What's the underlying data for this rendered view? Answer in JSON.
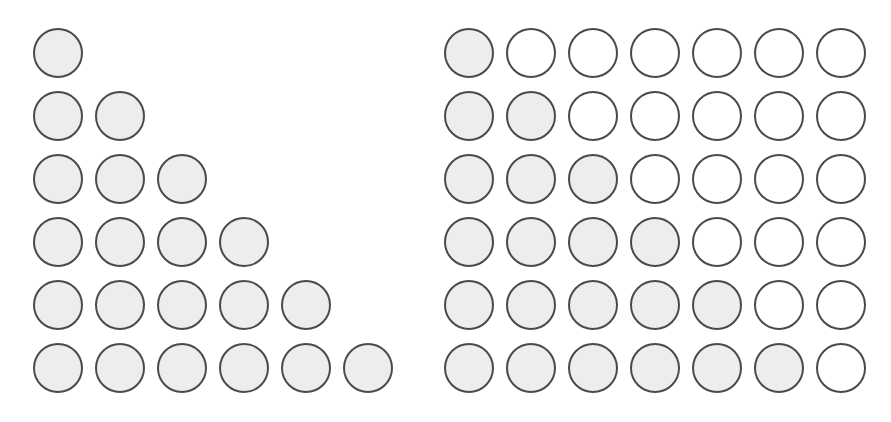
{
  "figure": {
    "background_color": "#ffffff",
    "width": 891,
    "height": 422
  },
  "style": {
    "circle_stroke_color": "#4a4a4a",
    "circle_fill_color": "#ededed",
    "circle_empty_color": "#ffffff",
    "circle_diameter": 50,
    "circle_stroke_width": 2
  },
  "chart_data": {
    "type": "diagram",
    "xlabel": "",
    "ylabel": "",
    "panels": [
      {
        "name": "triangle",
        "label": "Staircase triangle",
        "rows": 6,
        "columns": 6,
        "filled_per_row": [
          1,
          2,
          3,
          4,
          5,
          6
        ],
        "empty_per_row": [
          0,
          0,
          0,
          0,
          0,
          0
        ],
        "total_circles": 21,
        "total_filled": 21,
        "total_empty": 0,
        "origin_x": 33,
        "origin_y": 28,
        "step_x": 62,
        "step_y": 63
      },
      {
        "name": "rectangle",
        "label": "Completed rectangle",
        "rows": 6,
        "columns": 7,
        "filled_per_row": [
          1,
          2,
          3,
          4,
          5,
          6
        ],
        "empty_per_row": [
          6,
          5,
          4,
          3,
          2,
          1
        ],
        "total_circles": 42,
        "total_filled": 21,
        "total_empty": 21,
        "origin_x": 24,
        "origin_y": 28,
        "step_x": 62,
        "step_y": 63
      }
    ]
  }
}
